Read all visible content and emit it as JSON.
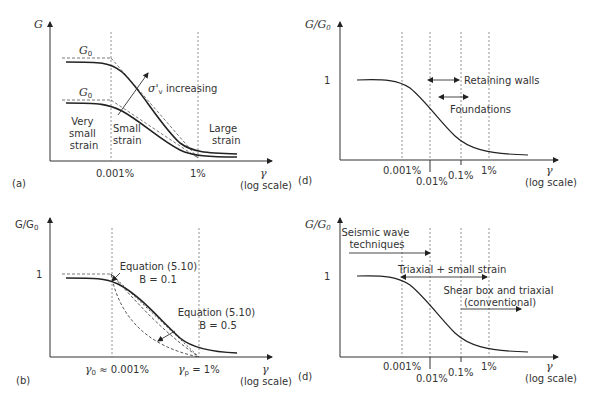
{
  "panels": {
    "a": {
      "label": "(a)",
      "y_axis_label": "G",
      "x_axis_symbol": "γ",
      "x_axis_note": "(log scale)",
      "x_ticks": [
        "0.001%",
        "1%"
      ],
      "curve_labels": [
        "G0",
        "G0"
      ],
      "g0_sub": "0",
      "g0_main": "G",
      "annotation_arrow": "σ'v increasing",
      "annotation_sigma": "σ'",
      "annotation_sub": "v",
      "annotation_rest": " increasing",
      "regions": [
        {
          "lines": [
            "Very",
            "small",
            "strain"
          ]
        },
        {
          "lines": [
            "Small",
            "strain"
          ]
        },
        {
          "lines": [
            "Large",
            "strain"
          ]
        }
      ]
    },
    "b": {
      "label": "(b)",
      "y_axis_label": "G/G0",
      "y_axis_main": "G/G",
      "y_axis_sub": "0",
      "y_tick": "1",
      "x_axis_symbol": "γ",
      "x_axis_note": "(log scale)",
      "x_tick_left": "γ0 ≈ 0.001%",
      "x_tick_left_sym": "γ",
      "x_tick_left_sub": "0",
      "x_tick_left_rest": " ≈ 0.001%",
      "x_tick_right_sym": "γ",
      "x_tick_right_sub": "p",
      "x_tick_right_rest": " = 1%",
      "annotations": [
        {
          "line1": "Equation (5.10)",
          "line2": "B = 0.1"
        },
        {
          "line1": "Equation (5.10)",
          "line2": "B = 0.5"
        }
      ]
    },
    "d_top": {
      "label": "(d)",
      "y_axis_main": "G/G",
      "y_axis_sub": "0",
      "y_tick": "1",
      "x_axis_symbol": "γ",
      "x_axis_note": "(log scale)",
      "x_ticks": [
        "0.001%",
        "0.01%",
        "0.1%",
        "1%"
      ],
      "ranges": [
        {
          "label": "Retaining walls",
          "from": "0.01%",
          "to": "0.1%"
        },
        {
          "label": "Foundations",
          "from": "~0.02%",
          "to": "~0.15%"
        }
      ]
    },
    "d_bottom": {
      "label": "(d)",
      "y_axis_main": "G/G",
      "y_axis_sub": "0",
      "y_tick": "1",
      "x_axis_symbol": "γ",
      "x_axis_note": "(log scale)",
      "x_ticks": [
        "0.001%",
        "0.01%",
        "0.1%",
        "1%"
      ],
      "ranges": [
        {
          "line1": "Seismic wave",
          "line2": "techniques"
        },
        {
          "line1": "Triaxial + small strain"
        },
        {
          "line1": "Shear box and triaxial",
          "line2": "(conventional)"
        }
      ]
    }
  }
}
